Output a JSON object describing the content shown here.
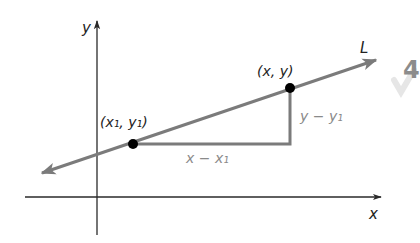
{
  "diagram": {
    "colors": {
      "axis": "#2a2a2a",
      "line": "#7b7b7b",
      "leg": "#7b7b7b",
      "point": "#000000",
      "label_dark": "#222222",
      "label_gray": "#8a8a8a",
      "background": "#ffffff",
      "badge": "#8c8c8c"
    },
    "axes": {
      "x_label": "x",
      "y_label": "y"
    },
    "line": {
      "label": "L"
    },
    "points": [
      {
        "id": "p1",
        "label": "(x₁, y₁)"
      },
      {
        "id": "p2",
        "label": "(x, y)"
      }
    ],
    "legs": {
      "horizontal_label": "x − x₁",
      "vertical_label": "y − y₁"
    },
    "edge_badge": {
      "text": "4"
    }
  }
}
